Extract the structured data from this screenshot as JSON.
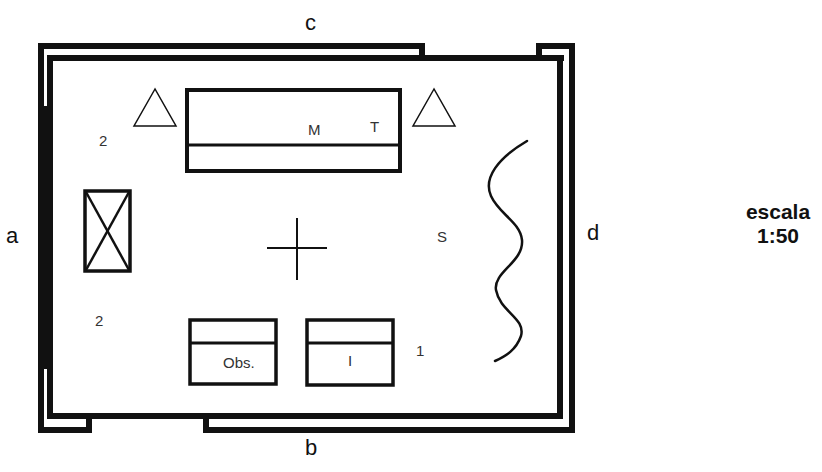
{
  "diagram": {
    "type": "floor-plan",
    "scale": {
      "label": "escala",
      "ratio": "1:50"
    },
    "walls": {
      "top": "c",
      "bottom": "b",
      "left": "a",
      "right": "d"
    },
    "furniture": {
      "main_desk": {
        "labels": [
          "M",
          "T"
        ]
      },
      "observer_desk": {
        "label": "Obs."
      },
      "second_desk": {
        "label": "I"
      },
      "crossed_box": {
        "symbol": "x-box"
      },
      "curtain": {
        "symbol": "wavy-line"
      },
      "center_mark": {
        "symbol": "cross"
      }
    },
    "markers": [
      {
        "id": "upper-left-number",
        "text": "2"
      },
      {
        "id": "lower-left-number",
        "text": "2"
      },
      {
        "id": "right-number",
        "text": "1"
      },
      {
        "id": "s-label",
        "text": "S"
      }
    ],
    "triangles": 2,
    "colors": {
      "line": "#111111",
      "background": "#ffffff"
    }
  }
}
